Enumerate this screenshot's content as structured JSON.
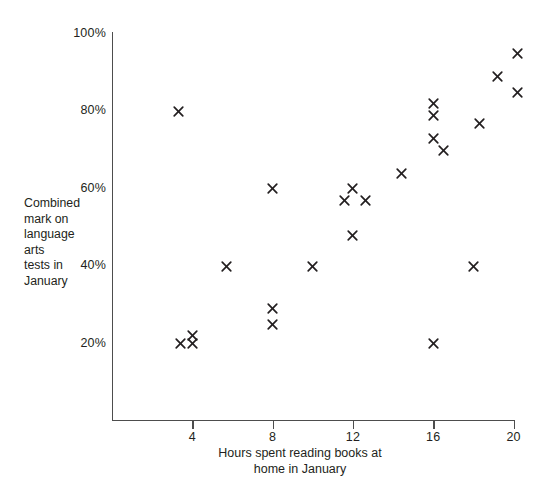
{
  "chart_data": {
    "type": "scatter",
    "title": "",
    "xlabel": "Hours spent reading books at home in January",
    "xlabel_lines": [
      "Hours spent reading books at",
      "home in January"
    ],
    "ylabel": "Combined mark on language arts tests in January",
    "ylabel_lines": [
      "Combined",
      "mark on",
      "language",
      "arts",
      "tests in",
      "January"
    ],
    "xlim": [
      0,
      21
    ],
    "ylim": [
      0,
      105
    ],
    "xticks": [
      4,
      8,
      12,
      16,
      20
    ],
    "xtick_labels": [
      "4",
      "8",
      "12",
      "16",
      "20"
    ],
    "yticks": [
      20,
      40,
      60,
      80,
      100
    ],
    "ytick_labels": [
      "20%",
      "40%",
      "60%",
      "80%",
      "100%"
    ],
    "grid": false,
    "legend": false,
    "marker": "x",
    "marker_color": "#231f20",
    "axis_color": "#4d4d4d",
    "background_color": "#ffffff",
    "point_count": 24,
    "points": [
      {
        "x": 3.3,
        "y": 80
      },
      {
        "x": 3.4,
        "y": 20
      },
      {
        "x": 4.0,
        "y": 22
      },
      {
        "x": 4.0,
        "y": 20
      },
      {
        "x": 5.7,
        "y": 40
      },
      {
        "x": 8.0,
        "y": 60
      },
      {
        "x": 8.0,
        "y": 29
      },
      {
        "x": 8.0,
        "y": 25
      },
      {
        "x": 10.0,
        "y": 40
      },
      {
        "x": 11.6,
        "y": 57
      },
      {
        "x": 12.0,
        "y": 60
      },
      {
        "x": 12.0,
        "y": 48
      },
      {
        "x": 12.6,
        "y": 57
      },
      {
        "x": 14.4,
        "y": 64
      },
      {
        "x": 16.0,
        "y": 82
      },
      {
        "x": 16.0,
        "y": 79
      },
      {
        "x": 16.0,
        "y": 73
      },
      {
        "x": 16.0,
        "y": 20
      },
      {
        "x": 16.5,
        "y": 70
      },
      {
        "x": 18.0,
        "y": 40
      },
      {
        "x": 18.3,
        "y": 77
      },
      {
        "x": 19.2,
        "y": 89
      },
      {
        "x": 20.2,
        "y": 95
      },
      {
        "x": 20.2,
        "y": 85
      }
    ]
  },
  "geometry": {
    "x_origin_px": 112,
    "x_unit_px": 20.08,
    "y_zero_px": 421,
    "y_unit_px": 3.87
  }
}
